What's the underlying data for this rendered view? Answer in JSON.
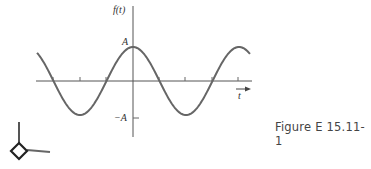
{
  "caption": "Figure E 15.11-1",
  "chart_data": {
    "type": "line",
    "title": "",
    "function": "f(t) = A cos(ωt)",
    "ylabel": "f(t)",
    "xlabel": "t",
    "ytick_labels": [
      "A",
      "−A"
    ],
    "series": [
      {
        "name": "f(t)",
        "shape": "cosine",
        "amplitude_label": "A"
      }
    ],
    "x_range_periods": [
      -1.8,
      2.2
    ],
    "grid": false,
    "legend": null
  },
  "labels": {
    "y_axis": "f(t)",
    "x_axis": "t",
    "peak": "A",
    "trough": "−A"
  }
}
